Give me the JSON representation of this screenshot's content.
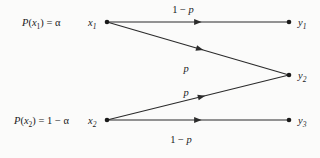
{
  "figure": {
    "type": "channel-transition-diagram",
    "background_color": "#fbfbfa",
    "ink_color": "#1a1a1a",
    "width": 320,
    "height": 158
  },
  "prior_labels": [
    {
      "id": "prior-x1",
      "text": "P(x₁) = α",
      "x": 22,
      "y": 26
    },
    {
      "id": "prior-x2",
      "text": "P(x₂) = 1 − α",
      "x": 14,
      "y": 124
    }
  ],
  "input_nodes": [
    {
      "id": "x1",
      "label": "x₁",
      "label_x": 88,
      "label_y": 26,
      "cx": 107,
      "cy": 22
    },
    {
      "id": "x2",
      "label": "x₂",
      "label_x": 88,
      "label_y": 124,
      "cx": 107,
      "cy": 120
    }
  ],
  "output_nodes": [
    {
      "id": "y1",
      "label": "y₁",
      "label_x": 298,
      "label_y": 26,
      "cx": 289,
      "cy": 22
    },
    {
      "id": "y2",
      "label": "y₂",
      "label_x": 298,
      "label_y": 79,
      "cx": 289,
      "cy": 75
    },
    {
      "id": "y3",
      "label": "y₃",
      "label_x": 298,
      "label_y": 124,
      "cx": 289,
      "cy": 120
    }
  ],
  "edges": [
    {
      "id": "edge-x1-y1",
      "from": "x1",
      "to": "y1",
      "x1": 107,
      "y1": 22,
      "x2": 289,
      "y2": 22,
      "arrow_t": 0.52,
      "label": "1 − p",
      "label_x": 183,
      "label_y": 13
    },
    {
      "id": "edge-x1-y2",
      "from": "x1",
      "to": "y2",
      "x1": 107,
      "y1": 22,
      "x2": 289,
      "y2": 75,
      "arrow_t": 0.53,
      "label": "p",
      "label_x": 186,
      "label_y": 72
    },
    {
      "id": "edge-x2-y2",
      "from": "x2",
      "to": "y2",
      "x1": 107,
      "y1": 120,
      "x2": 289,
      "y2": 75,
      "arrow_t": 0.54,
      "label": "p",
      "label_x": 186,
      "label_y": 96
    },
    {
      "id": "edge-x2-y3",
      "from": "x2",
      "to": "y3",
      "x1": 107,
      "y1": 120,
      "x2": 289,
      "y2": 120,
      "arrow_t": 0.52,
      "label": "1 − p",
      "label_x": 181,
      "label_y": 143
    }
  ],
  "chart_data": {
    "type": "diagram",
    "title": "",
    "inputs": [
      "x1",
      "x2"
    ],
    "outputs": [
      "y1",
      "y2",
      "y3"
    ],
    "input_priors": {
      "x1": "α",
      "x2": "1 − α"
    },
    "transitions": [
      {
        "from": "x1",
        "to": "y1",
        "probability": "1 − p"
      },
      {
        "from": "x1",
        "to": "y2",
        "probability": "p"
      },
      {
        "from": "x2",
        "to": "y2",
        "probability": "p"
      },
      {
        "from": "x2",
        "to": "y3",
        "probability": "1 − p"
      }
    ]
  }
}
